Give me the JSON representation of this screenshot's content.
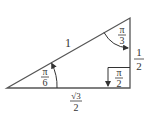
{
  "diagram": {
    "colors": {
      "stroke": "#555555",
      "text": "#333333",
      "background": "#ffffff"
    },
    "vertices": {
      "left": [
        7,
        88
      ],
      "top": [
        130,
        18
      ],
      "right_angle": [
        130,
        88
      ]
    },
    "sides": {
      "hypotenuse": "1",
      "vertical": {
        "numerator": "1",
        "denominator": "2"
      },
      "base": {
        "numerator": "√3",
        "denominator": "2"
      }
    },
    "angles": {
      "left": {
        "numerator": "π",
        "denominator": "6"
      },
      "top": {
        "numerator": "π",
        "denominator": "3"
      },
      "right": {
        "numerator": "π",
        "denominator": "2"
      }
    }
  }
}
